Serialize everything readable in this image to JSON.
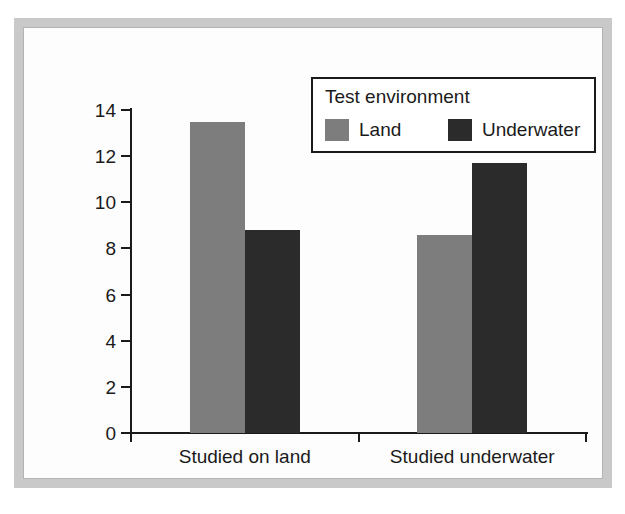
{
  "chart_data": {
    "type": "bar",
    "title": "",
    "xlabel": "",
    "ylabel": "Mean words recalled",
    "ylim": [
      0,
      14
    ],
    "ytick_labels": [
      "0",
      "2",
      "4",
      "6",
      "8",
      "10",
      "12",
      "14"
    ],
    "ytick_values": [
      0,
      2,
      4,
      6,
      8,
      10,
      12,
      14
    ],
    "grid": false,
    "legend_position": "top-right",
    "legend_title": "Test environment",
    "categories": [
      "Studied on land",
      "Studied underwater"
    ],
    "series": [
      {
        "name": "Land",
        "color": "#7d7d7d",
        "values": [
          13.5,
          8.6
        ]
      },
      {
        "name": "Underwater",
        "color": "#2b2b2b",
        "values": [
          8.8,
          11.7
        ]
      }
    ]
  },
  "figure": {
    "frame_color": "#c9c9c9",
    "background": "#ffffff",
    "axis_color": "#1a1a1a"
  }
}
